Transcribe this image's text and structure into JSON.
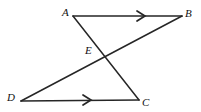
{
  "figure": {
    "type": "geometry-diagram",
    "canvas": {
      "width": 201,
      "height": 112
    },
    "colors": {
      "background": "#ffffff",
      "stroke": "#262626",
      "label": "#111111"
    },
    "stroke_width": 1.6,
    "points": [
      {
        "name": "A",
        "label": "A",
        "x": 73,
        "y": 16,
        "label_x": 62,
        "label_y": 7
      },
      {
        "name": "B",
        "label": "B",
        "x": 182,
        "y": 16,
        "label_x": 185,
        "label_y": 8
      },
      {
        "name": "C",
        "label": "C",
        "x": 139,
        "y": 100,
        "label_x": 142,
        "label_y": 97
      },
      {
        "name": "D",
        "label": "D",
        "x": 21,
        "y": 101,
        "label_x": 7,
        "label_y": 92
      },
      {
        "name": "E",
        "label": "E",
        "x": 106,
        "y": 58,
        "label_x": 85,
        "label_y": 45
      }
    ],
    "segments": [
      {
        "name": "segment-AB",
        "from": "A",
        "to": "B",
        "x1": 73,
        "y1": 16,
        "x2": 182,
        "y2": 16,
        "tick": "single-arrow"
      },
      {
        "name": "segment-DC",
        "from": "D",
        "to": "C",
        "x1": 21,
        "y1": 101,
        "x2": 139,
        "y2": 100,
        "tick": "single-arrow"
      },
      {
        "name": "segment-AC",
        "from": "A",
        "to": "C",
        "x1": 73,
        "y1": 16,
        "x2": 139,
        "y2": 100,
        "tick": "none"
      },
      {
        "name": "segment-DB",
        "from": "D",
        "to": "B",
        "x1": 21,
        "y1": 101,
        "x2": 182,
        "y2": 16,
        "tick": "none"
      }
    ],
    "arrow_marks": [
      {
        "name": "parallel-arrow-ab",
        "on": "segment-AB",
        "x": 143,
        "y": 16,
        "direction": "right"
      },
      {
        "name": "parallel-arrow-dc",
        "on": "segment-DC",
        "x": 89,
        "y": 100,
        "direction": "right"
      }
    ]
  }
}
